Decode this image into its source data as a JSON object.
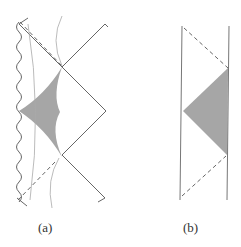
{
  "figure": {
    "panels": [
      {
        "id": "a",
        "label": "(a)",
        "elements": [
          "wavy-singularity-left-edge",
          "zigzag-boundary-right",
          "dashed-null-lines",
          "curved-hyperbolae",
          "shaded-diamond-region"
        ]
      },
      {
        "id": "b",
        "label": "(b)",
        "elements": [
          "vertical-boundary-left",
          "vertical-boundary-right",
          "dashed-null-lines",
          "shaded-triangle-region"
        ]
      }
    ],
    "colors": {
      "line": "#555555",
      "thin_curve": "#aaaaaa",
      "shade": "#a6a6a6",
      "dash": "#666666"
    }
  }
}
